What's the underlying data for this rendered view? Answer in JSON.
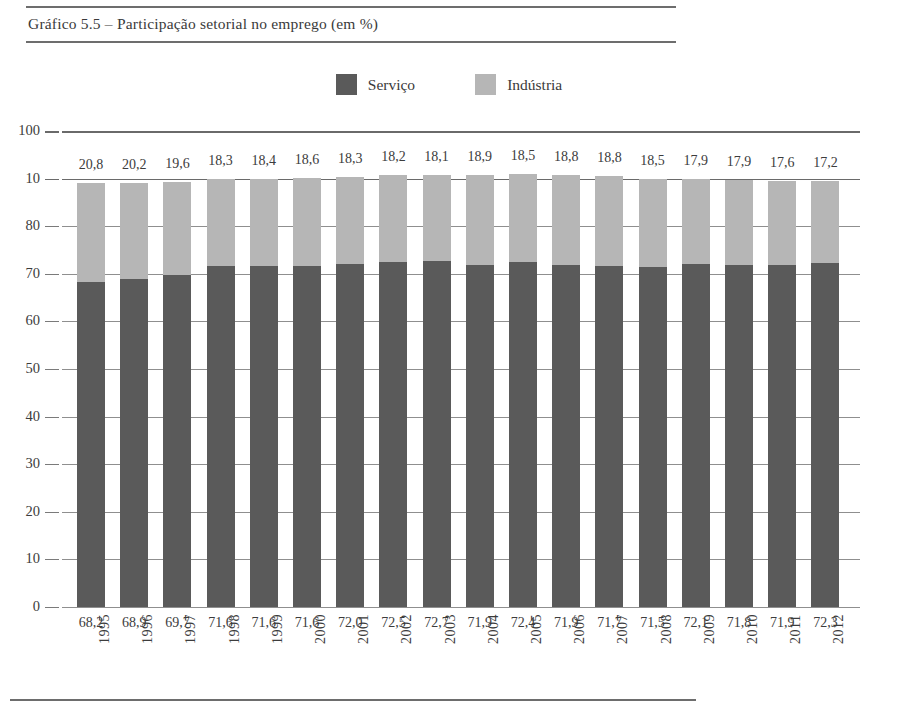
{
  "figure": {
    "title": "Gráfico 5.5 – Participação setorial no emprego (em %)"
  },
  "legend": {
    "items": [
      {
        "label": "Serviço",
        "color": "#5a5a5a",
        "swatch": "legend-swatch-servico"
      },
      {
        "label": "Indústria",
        "color": "#b6b6b6",
        "swatch": "legend-swatch-industria"
      }
    ]
  },
  "axis": {
    "y_tick_labels": [
      "100",
      "10",
      "80",
      "70",
      "60",
      "50",
      "40",
      "30",
      "20",
      "10",
      "0"
    ],
    "y_tick_values": [
      100,
      90,
      80,
      70,
      60,
      50,
      40,
      30,
      20,
      10,
      0
    ]
  },
  "chart_data": {
    "type": "bar",
    "title": "Gráfico 5.5 – Participação setorial no emprego (em %)",
    "xlabel": "",
    "ylabel": "",
    "ylim": [
      0,
      100
    ],
    "grid": true,
    "stacked": true,
    "legend_position": "top-center",
    "categories": [
      "1995",
      "1996",
      "1997",
      "1998",
      "1999",
      "2000",
      "2001",
      "2002",
      "2003",
      "2004",
      "2005",
      "2006",
      "2007",
      "2008",
      "2009",
      "2010",
      "2011",
      "2012"
    ],
    "series": [
      {
        "name": "Serviço",
        "color": "#5a5a5a",
        "label_position": "below-axis",
        "values": [
          68.2,
          68.9,
          69.7,
          71.6,
          71.6,
          71.6,
          72.0,
          72.5,
          72.7,
          71.9,
          72.4,
          71.9,
          71.7,
          71.5,
          72.1,
          71.8,
          71.9,
          72.3
        ],
        "value_labels": [
          "68,2",
          "68,9",
          "69,7",
          "71,6",
          "71,6",
          "71,6",
          "72,0",
          "72,5",
          "72,7",
          "71,9",
          "72,4",
          "71,9",
          "71,7",
          "71,5",
          "72,1",
          "71,8",
          "71,9",
          "72,3"
        ]
      },
      {
        "name": "Indústria",
        "color": "#b6b6b6",
        "label_position": "above-bar",
        "values": [
          20.8,
          20.2,
          19.6,
          18.3,
          18.4,
          18.6,
          18.3,
          18.2,
          18.1,
          18.9,
          18.5,
          18.8,
          18.8,
          18.5,
          17.9,
          17.9,
          17.6,
          17.2
        ],
        "value_labels": [
          "20,8",
          "20,2",
          "19,6",
          "18,3",
          "18,4",
          "18,6",
          "18,3",
          "18,2",
          "18,1",
          "18,9",
          "18,5",
          "18,8",
          "18,8",
          "18,5",
          "17,9",
          "17,9",
          "17,6",
          "17,2"
        ]
      }
    ]
  }
}
